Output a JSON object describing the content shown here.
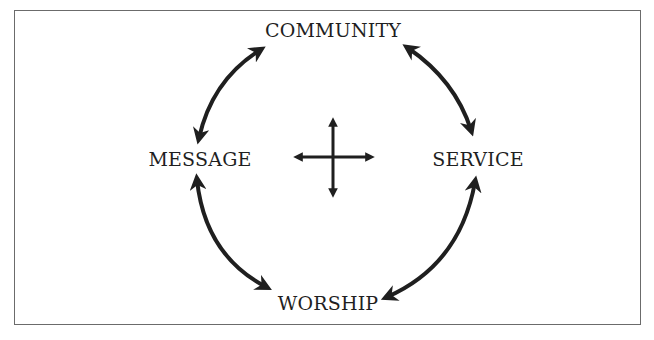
{
  "diagram": {
    "type": "cycle",
    "nodes": [
      {
        "id": "community",
        "label": "COMMUNITY"
      },
      {
        "id": "service",
        "label": "SERVICE"
      },
      {
        "id": "worship",
        "label": "WORSHIP"
      },
      {
        "id": "message",
        "label": "MESSAGE"
      }
    ],
    "edges": [
      {
        "from": "message",
        "to": "community",
        "bidirectional": true
      },
      {
        "from": "community",
        "to": "service",
        "bidirectional": true
      },
      {
        "from": "service",
        "to": "worship",
        "bidirectional": true
      },
      {
        "from": "worship",
        "to": "message",
        "bidirectional": true
      }
    ],
    "center_icon": "four-way-arrow-icon",
    "colors": {
      "stroke": "#1f1f1f",
      "border": "#6b6b6b",
      "background": "#ffffff"
    }
  }
}
